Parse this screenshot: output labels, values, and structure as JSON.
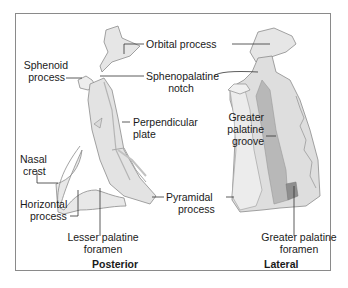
{
  "figure": {
    "views": [
      {
        "id": "posterior",
        "caption": "Posterior"
      },
      {
        "id": "lateral",
        "caption": "Lateral"
      }
    ],
    "labels": {
      "orbital_process": "Orbital process",
      "sphenoid_process_l1": "Sphenoid",
      "sphenoid_process_l2": "process",
      "sphenopalatine_notch_l1": "Sphenopalatine",
      "sphenopalatine_notch_l2": "notch",
      "perpendicular_plate_l1": "Perpendicular",
      "perpendicular_plate_l2": "plate",
      "greater_palatine_groove_l1": "Greater",
      "greater_palatine_groove_l2": "palatine",
      "greater_palatine_groove_l3": "groove",
      "nasal_crest_l1": "Nasal",
      "nasal_crest_l2": "crest",
      "horizontal_process_l1": "Horizontal",
      "horizontal_process_l2": "process",
      "pyramidal_process_l1": "Pyramidal",
      "pyramidal_process_l2": "process",
      "lesser_palatine_foramen_l1": "Lesser palatine",
      "lesser_palatine_foramen_l2": "foramen",
      "greater_palatine_foramen_l1": "Greater palatine",
      "greater_palatine_foramen_l2": "foramen"
    },
    "colors": {
      "bone_light": "#e9e9e9",
      "bone_mid": "#cfcfcf",
      "bone_dark": "#a8a8a8",
      "outline": "#8c8c8c",
      "leader": "#333333",
      "frame": "#8a8a8a"
    }
  }
}
